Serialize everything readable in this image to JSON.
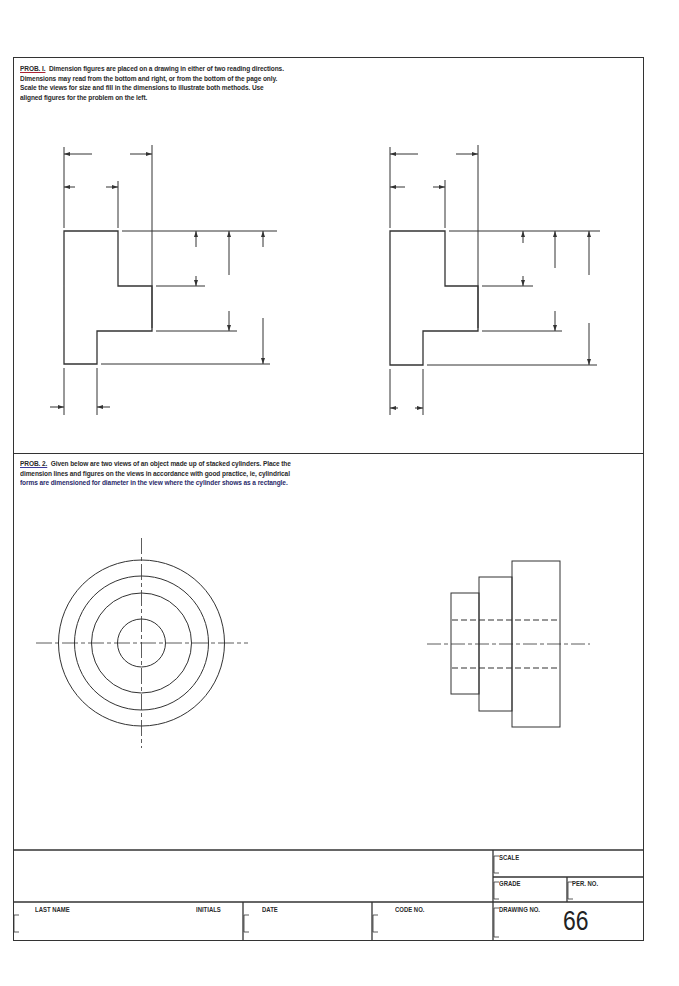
{
  "problem1": {
    "label": "PROB. I.",
    "lines": [
      "Dimension figures are placed on a drawing in either of two reading directions.",
      "Dimensions may read from the bottom and right, or from the bottom of the page only.",
      "Scale the views for size and fill in the dimensions to illustrate both methods.  Use",
      "aligned figures for the problem on the left."
    ],
    "views": [
      "left view (aligned figures)",
      "right view (unidirectional figures)"
    ]
  },
  "problem2": {
    "label": "PROB. 2.",
    "lines": [
      "Given below are two views of an object made up of stacked cylinders.  Place the",
      "dimension lines and figures on the views in accordance with good practice, ie, cylindrical",
      "forms are dimensioned for diameter in the view where the cylinder shows as a rectangle."
    ],
    "views": [
      "front view: 4 concentric circles",
      "side view: 3 stacked cylinders with hidden bore"
    ]
  },
  "title_block": {
    "scale_label": "SCALE",
    "grade_label": "GRADE",
    "per_no_label": "PER.  NO.",
    "last_name_label": "LAST  NAME",
    "initials_label": "INITIALS",
    "date_label": "DATE",
    "code_no_label": "CODE  NO.",
    "drawing_no_label": "DRAWING  NO.",
    "drawing_no": "66"
  }
}
